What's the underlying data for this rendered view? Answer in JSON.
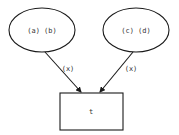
{
  "diagram": {
    "type": "graph",
    "nodes": [
      {
        "id": "left-ellipse",
        "shape": "ellipse",
        "label": "(a) (b)"
      },
      {
        "id": "right-ellipse",
        "shape": "ellipse",
        "label": "(c) (d)"
      },
      {
        "id": "target-box",
        "shape": "rectangle",
        "label": "t"
      }
    ],
    "edges": [
      {
        "from": "left-ellipse",
        "to": "target-box",
        "label": "(x)"
      },
      {
        "from": "right-ellipse",
        "to": "target-box",
        "label": "(x)"
      }
    ],
    "colors": {
      "stroke": "#1a1a1a",
      "text": "#333333",
      "background": "#ffffff"
    }
  }
}
